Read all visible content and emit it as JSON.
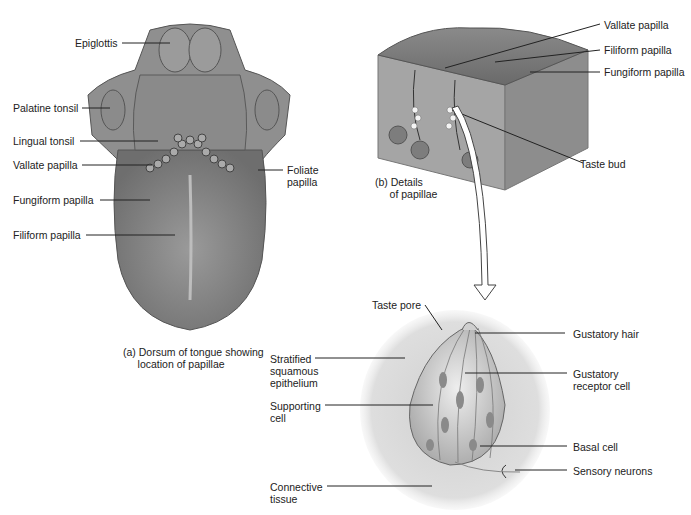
{
  "figure": {
    "panel_a": {
      "caption": "(a) Dorsum of tongue showing\n     location of papillae",
      "labels": {
        "epiglottis": "Epiglottis",
        "palatine_tonsil": "Palatine tonsil",
        "lingual_tonsil": "Lingual tonsil",
        "vallate_papilla": "Vallate papilla",
        "fungiform_papilla": "Fungiform papilla",
        "filiform_papilla": "Filiform papilla",
        "foliate_papilla": "Foliate\npapilla"
      }
    },
    "panel_b": {
      "caption": "(b) Details\n     of papillae",
      "labels": {
        "vallate_papilla": "Vallate papilla",
        "filiform_papilla": "Filiform papilla",
        "fungiform_papilla": "Fungiform papilla",
        "taste_bud": "Taste bud"
      }
    },
    "panel_c": {
      "labels": {
        "taste_pore": "Taste pore",
        "gustatory_hair": "Gustatory hair",
        "stratified_squamous_epithelium": "Stratified\nsquamous\nepithelium",
        "gustatory_receptor_cell": "Gustatory\nreceptor cell",
        "supporting_cell": "Supporting\ncell",
        "basal_cell": "Basal cell",
        "sensory_neurons": "Sensory neurons",
        "connective_tissue": "Connective\ntissue"
      }
    }
  }
}
